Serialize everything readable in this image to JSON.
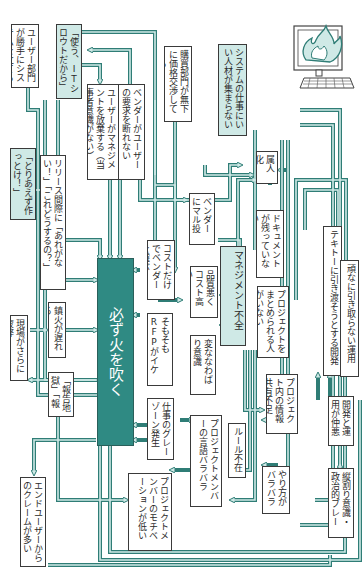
{
  "diagram": {
    "title": "",
    "theme": {
      "wire_color": "#2f7d76",
      "wire_inner": "#cfe9e6",
      "box_border": "#3a3a3a",
      "highlight_box": "#cfe9e6",
      "central_box": "#2f8a83"
    },
    "icon": "burning-computer-icon",
    "nodes": {
      "user_dept": "ユーザー部門が勝手にシステムを立てる",
      "tsukaikake": "「使う、ITシロウトだから」",
      "user_mgmt": "ユーザーがマネジメントを放棄する（当事者意識がない）",
      "vendor_refuse": "ベンダーがユーザーの要求を断れない",
      "purchasing": "購買部門が無下に価格交渉してくる",
      "system_talent": "システムの仕事にいい人材が集まらない",
      "toriaezu": "「とりあえず作っとけ！」",
      "release": "リリース間際に「あれがない！」「これどうするの？」",
      "vendor_marunage": "ベンダーにマル投げ",
      "zokujinka": "属人化",
      "no_docs": "ドキュメントが残っていない",
      "cost_vendor": "コストだけでベンダーを選ぶ",
      "quality_cost": "品質悪くコスト高い",
      "mgmt_lack": "マネジメント不全",
      "tekito": "テキトーに引き渡そうとする開発",
      "ganko": "頑なに引き取らない運用",
      "no_leader": "プロジェクトをまとめられる人がいない",
      "central": "必ず火を吹く",
      "somosomo_rfp": "そもそもRFPがイケていない",
      "nawabari": "変ななわばり意識",
      "info_share": "プロジェクト内の情報共有不足",
      "kaika_delay": "鎮火が遅れる",
      "genba": "現場がさらに疲弊",
      "hokoku": "「報告地獄」「報告祭り」",
      "gray_zone": "仕事のグレーゾーン発生",
      "member_language": "プロジェクトメンバーの言語バラバラ",
      "rule_absent": "ルール不在",
      "yarikata": "やり方がバラバラ",
      "dev_ops_bad": "開発と運用が仲悪い",
      "tatewari": "縦割り意識・政治的ブレーキ",
      "motivation": "プロジェクトメンバーのモチベーションが低い",
      "end_user": "エンドユーザーからのクレームが多い"
    }
  }
}
